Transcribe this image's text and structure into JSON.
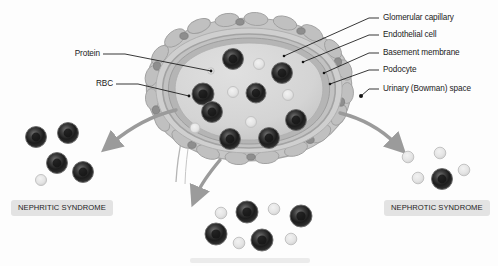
{
  "figure": {
    "background_color": "#fdfdfd"
  },
  "labels_left": [
    {
      "id": "protein",
      "text": "Protein",
      "x": 100,
      "y": 50,
      "anchor_x": 211,
      "anchor_y": 71
    },
    {
      "id": "rbc",
      "text": "RBC",
      "x": 113,
      "y": 80,
      "anchor_x": 189,
      "anchor_y": 96
    }
  ],
  "labels_right": [
    {
      "id": "glomerular-capillary",
      "text": "Glomerular capillary",
      "x": 383,
      "y": 14,
      "anchor_x": 284,
      "anchor_y": 56
    },
    {
      "id": "endothelial-cell",
      "text": "Endothelial cell",
      "x": 383,
      "y": 31,
      "anchor_x": 303,
      "anchor_y": 62
    },
    {
      "id": "basement-membrane",
      "text": "Basement membrane",
      "x": 383,
      "y": 49,
      "anchor_x": 324,
      "anchor_y": 73
    },
    {
      "id": "podocyte",
      "text": "Podocyte",
      "x": 383,
      "y": 66,
      "anchor_x": 330,
      "anchor_y": 84
    },
    {
      "id": "urinary-bowman-space",
      "text": "Urinary (Bowman) space",
      "x": 383,
      "y": 85,
      "anchor_x": 361,
      "anchor_y": 96
    }
  ],
  "syndromes": [
    {
      "id": "nephritic",
      "label": "NEPHRITIC SYNDROME",
      "x": 11,
      "y": 200
    },
    {
      "id": "nephrotic",
      "label": "NEPHROTIC SYNDROME",
      "x": 384,
      "y": 200
    }
  ],
  "colors": {
    "rbc_dark": "#1f1f1f",
    "rbc_mid": "#4a4a4a",
    "rbc_rim": "#6f6f6f",
    "protein_fill": "#e2e2e2",
    "protein_stroke": "#c3c3c3",
    "capsule_fill": "#dcdcdc",
    "capsule_stroke": "#a8a8a8",
    "lumen_fill": "#d2d2d2",
    "podocyte_fill": "#b9b9b9",
    "podocyte_stroke": "#9a9a9a",
    "arrow_gray": "#9b9b9b",
    "leader_line": "#141414",
    "badge_bg": "#e3e3e3",
    "text": "#1b1b1b"
  },
  "cells": {
    "glomerulus_rbc": [
      {
        "cx": 233,
        "cy": 59,
        "r": 10.5
      },
      {
        "cx": 282,
        "cy": 73,
        "r": 10.5
      },
      {
        "cx": 203,
        "cy": 94,
        "r": 11
      },
      {
        "cx": 256,
        "cy": 93,
        "r": 10
      },
      {
        "cx": 212,
        "cy": 112,
        "r": 10.5
      },
      {
        "cx": 296,
        "cy": 120,
        "r": 10.5
      },
      {
        "cx": 230,
        "cy": 139,
        "r": 10.5
      },
      {
        "cx": 269,
        "cy": 138,
        "r": 10.5
      }
    ],
    "glomerulus_protein": [
      {
        "cx": 259,
        "cy": 64,
        "r": 5.5
      },
      {
        "cx": 211,
        "cy": 71,
        "r": 3.2
      },
      {
        "cx": 233,
        "cy": 92,
        "r": 5.5
      },
      {
        "cx": 288,
        "cy": 95,
        "r": 5.5
      },
      {
        "cx": 251,
        "cy": 122,
        "r": 5.5
      },
      {
        "cx": 195,
        "cy": 128,
        "r": 5
      }
    ],
    "nephritic_cluster": {
      "rbc": [
        {
          "cx": 36,
          "cy": 137,
          "r": 10.5
        },
        {
          "cx": 68,
          "cy": 133,
          "r": 10.5
        },
        {
          "cx": 57,
          "cy": 163,
          "r": 10.5
        },
        {
          "cx": 83,
          "cy": 172,
          "r": 10.5
        }
      ],
      "protein": [
        {
          "cx": 41,
          "cy": 180,
          "r": 5.5
        }
      ]
    },
    "nephrotic_cluster": {
      "protein": [
        {
          "cx": 408,
          "cy": 157,
          "r": 5.8
        },
        {
          "cx": 440,
          "cy": 153,
          "r": 5.8
        },
        {
          "cx": 464,
          "cy": 170,
          "r": 5.8
        },
        {
          "cx": 418,
          "cy": 178,
          "r": 5.8
        }
      ],
      "rbc": [
        {
          "cx": 442,
          "cy": 179,
          "r": 10.5
        }
      ]
    },
    "center_cluster": {
      "rbc": [
        {
          "cx": 247,
          "cy": 212,
          "r": 11
        },
        {
          "cx": 301,
          "cy": 216,
          "r": 11
        },
        {
          "cx": 216,
          "cy": 234,
          "r": 11
        },
        {
          "cx": 262,
          "cy": 240,
          "r": 11
        }
      ],
      "protein": [
        {
          "cx": 221,
          "cy": 213,
          "r": 5.8
        },
        {
          "cx": 274,
          "cy": 209,
          "r": 5.8
        },
        {
          "cx": 239,
          "cy": 243,
          "r": 5.8
        },
        {
          "cx": 291,
          "cy": 239,
          "r": 5.8
        }
      ]
    }
  },
  "arrows": [
    {
      "id": "arrow-to-nephritic",
      "path": "M 176 110 C 150 116 130 128 112 143"
    },
    {
      "id": "arrow-to-nephrotic",
      "path": "M 340 113 C 364 119 382 130 396 144"
    },
    {
      "id": "arrow-to-center",
      "path": "M 220 160 C 210 172 202 182 197 194"
    }
  ],
  "caption_bar": {
    "x": 190,
    "y": 258,
    "width": 120,
    "height": 5
  }
}
